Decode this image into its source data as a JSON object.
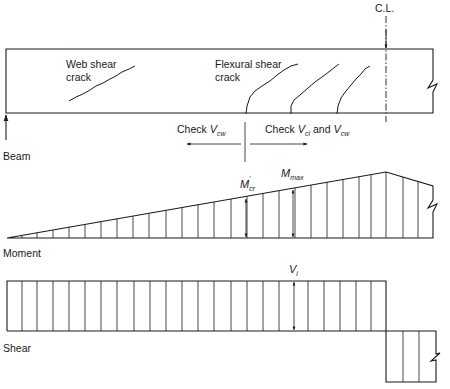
{
  "labels": {
    "centerline": "C.L.",
    "web_shear_line1": "Web shear",
    "web_shear_line2": "crack",
    "flexural_shear_line1": "Flexural shear",
    "flexural_shear_line2": "crack",
    "check_left_prefix": "Check ",
    "check_left_var": "V",
    "check_left_sub": "cw",
    "check_right_prefix": "Check ",
    "check_right_var1": "V",
    "check_right_sub1": "ci",
    "check_right_and": " and ",
    "check_right_var2": "V",
    "check_right_sub2": "cw",
    "beam": "Beam",
    "moment": "Moment",
    "shear": "Shear",
    "mcr_var": "M",
    "mcr_sub": "cr",
    "mcr_sup": "'",
    "mmax_var": "M",
    "mmax_sub": "max",
    "vi_var": "V",
    "vi_sub": "i"
  },
  "beam": {
    "x": 6,
    "y": 49,
    "right": 433,
    "bottom": 113,
    "centerline_x": 386
  },
  "moment_diagram": {
    "baseline_y": 238,
    "start_x": 7,
    "peak_x": 386,
    "peak_y": 172,
    "end_x": 433,
    "end_y": 186,
    "ordinates_x": [
      22,
      37,
      53,
      69,
      85,
      101,
      117,
      133,
      149,
      166,
      182,
      198,
      214,
      231,
      247,
      263,
      279,
      295,
      311,
      327,
      343,
      359,
      371,
      386,
      403,
      418
    ]
  },
  "shear_diagram": {
    "top_y": 281,
    "bottom_y": 331,
    "left_x": 7,
    "step_x": 386,
    "neg_right_x": 436,
    "neg_bottom_y": 382,
    "ordinates_x": [
      22,
      37,
      53,
      69,
      85,
      101,
      117,
      134,
      150,
      166,
      182,
      198,
      214,
      231,
      247,
      263,
      279,
      294,
      308,
      324,
      340,
      356,
      371
    ],
    "neg_ordinates_x": [
      403,
      419
    ]
  }
}
